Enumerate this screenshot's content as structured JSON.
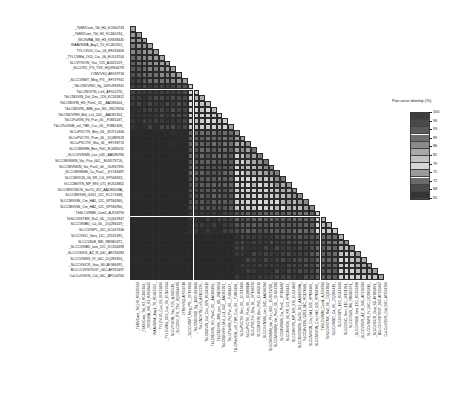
{
  "figure": {
    "type": "pairwise-identity-matrix",
    "background": "#ffffff"
  },
  "legend": {
    "title": "Pair-wise identity (%)",
    "ticks": [
      100,
      96,
      93,
      89,
      86,
      82,
      79,
      75,
      72,
      68,
      65
    ],
    "colors": [
      "#3c3c3c",
      "#4a4a4a",
      "#5a5a5a",
      "#6e6e6e",
      "#8a8a8a",
      "#a8a8a8",
      "#c2c2c2",
      "#d6d6d6",
      "#9a9a9a",
      "#6a6a6a",
      "#4a4a4a",
      "#343434"
    ],
    "min": 65,
    "max": 100
  },
  "labels": [
    "_TbMVCam_Tbl_H0_KC660743",
    "_TbMVCam_Tbl_H2_KC660744_",
    "_WCSVBA_Wtl_H3_KX838445",
    "WAAVSWA_Aay1_T0_KC462552_",
    "TYLCVUG_Cuc_06_EF433406",
    "_TYLCVMld_O03_Cuc_06_EU143744",
    "SLCVYVION_Yas_Y25_AJ425519_",
    "_SLCCRV_ITS_TSV_HQ393447I9",
    "LYMVVSQ-AF059718",
    "_SLCCVSMT_Meg_PG__EF197941",
    "_TbLCNDVSID_Sg_14/XU983941",
    "TbLCNDVTN_LoS_AF102276_",
    "TbLCNDVIN_Del_Des_12S_KC345812",
    "TbLCNDVIN_HD_PanC_05__AAD86404_",
    "TbLCNDVIN_JMB_pun_8G_JN129054",
    "TbLCNDVIRH_Mol_Lv1_042__AAD82302_",
    "TbLCPaVIIN_Pd_Pun_06__FJ831437_",
    "TbLCPaVIGB_sr0_TBK_Cuc_06__FJ882408_",
    "SLCuPVCTIV_Ben_06__EU712406",
    "SLCuPVCTIV_Pum_06__DQ889118",
    "SLCuPVCTIV_Sha_06__EF198774",
    "SLCCMVIHN_Ben_PdC_EU485031",
    "_SLCCVVNSIN_Lan_04C_AAD86784",
    "SLCCMVNSIN_Var_Pun_002__EU657371S_",
    "SLCCMVNSIN_Vat_Pun2_06__GU967391",
    "_SLCCMVNSIB_Ca_PunC__KY184487",
    "SLCCMVICN_06_KR_CG_KP168433_",
    "SLCCMVITN_MP_MG_071_EU543862",
    "SLCCMVCNICN_GuO5_052_AAD86208A_",
    "SLCCMVIGN_GZ01_11C_KC171848_",
    "SLCCMVIGN_Cm_HA1_12C_KP184960_",
    "SLCCMVIGN_Cm_HA2_12C_KP184960_",
    "TbSLCVINIM_Com1_AJ558794",
    "TbSLCVISTMX_Ra2_06__DQ347847",
    "SLCCVSIBD_Ca_06__DQ286419_",
    "SLCCVSIPL_16C_KC447446",
    "SLCCVSIC_Serv_11C_JX131391_",
    "SLCCVSLB_IM5_RM360371_",
    "_SLCCVSIBD_Iam_12C_KC356398",
    "_SLCCVSIVS_AZ_III_04C_AF236283",
    "SLCCVSIWS_IV_04C_DQ285816_",
    "_SLCCVSICR_Gua_SD-AY086491_",
    "BCLCCVVSIT0GT_06C-AF325497",
    "CuLCuVGVIS_Cal_06C_AFC04760"
  ],
  "chart_data": {
    "type": "heatmap",
    "shape": "lower-triangular",
    "n": 44,
    "title": "",
    "colorbar_label": "Pair-wise identity (%)",
    "value_range": [
      65,
      100
    ],
    "grid": true,
    "legend_position": "right"
  }
}
